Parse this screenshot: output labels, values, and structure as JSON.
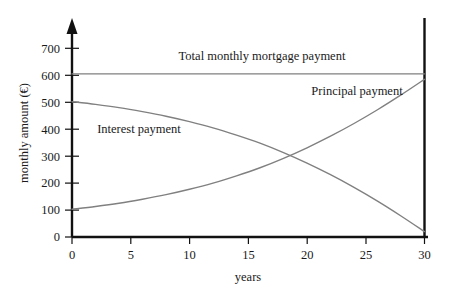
{
  "chart_data": {
    "type": "line",
    "title": "",
    "xlabel": "years",
    "ylabel": "monthly amount (€)",
    "xlim": [
      0,
      30
    ],
    "ylim": [
      0,
      730
    ],
    "grid": false,
    "legend_position": "inline-annotations",
    "xticks": [
      "0",
      "5",
      "10",
      "15",
      "20",
      "25",
      "30"
    ],
    "xtick_values": [
      0,
      5,
      10,
      15,
      20,
      25,
      30
    ],
    "yticks": [
      "0",
      "100",
      "200",
      "300",
      "400",
      "500",
      "600",
      "700"
    ],
    "ytick_values": [
      0,
      100,
      200,
      300,
      400,
      500,
      600,
      700
    ],
    "x": [
      0,
      2,
      4,
      6,
      8,
      10,
      12,
      14,
      16,
      18,
      20,
      22,
      24,
      26,
      28,
      30
    ],
    "series": [
      {
        "name": "Total monthly mortgage payment",
        "color": "#808080",
        "values": [
          605,
          605,
          605,
          605,
          605,
          605,
          605,
          605,
          605,
          605,
          605,
          605,
          605,
          605,
          605,
          605
        ]
      },
      {
        "name": "Interest payment",
        "color": "#808080",
        "values": [
          502,
          492,
          480,
          465,
          448,
          428,
          405,
          378,
          348,
          313,
          274,
          231,
          184,
          133,
          78,
          20
        ]
      },
      {
        "name": "Principal payment",
        "color": "#808080",
        "values": [
          103,
          113,
          125,
          140,
          157,
          177,
          200,
          227,
          257,
          292,
          331,
          374,
          421,
          472,
          527,
          585
        ]
      }
    ],
    "annotations": [
      {
        "name": "total-label",
        "text": "Total monthly mortgage payment",
        "x_px": 262,
        "y_px": 60
      },
      {
        "name": "principal-label",
        "text": "Principal payment",
        "x_px": 357,
        "y_px": 95
      },
      {
        "name": "interest-label",
        "text": "Interest payment",
        "x_px": 139,
        "y_px": 133
      }
    ],
    "marker_line": {
      "name": "year-30-vertical-line",
      "x_value": 30,
      "color": "#111111"
    }
  }
}
